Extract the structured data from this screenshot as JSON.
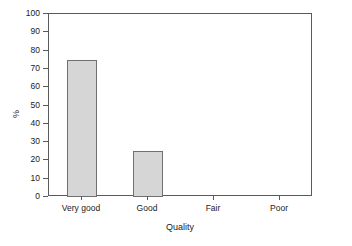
{
  "chart_data": {
    "type": "bar",
    "title": "",
    "subtitle": "",
    "categories": [
      "Very good",
      "Good",
      "Fair",
      "Poor"
    ],
    "values": [
      75,
      25,
      0,
      0
    ],
    "xlabel": "Quality",
    "ylabel": "%",
    "ylim": [
      0,
      100
    ],
    "ytick_labels": [
      "100",
      "90",
      "80",
      "70",
      "60",
      "50",
      "40",
      "30",
      "20",
      "10",
      "0"
    ],
    "ytick_values": [
      100,
      90,
      80,
      70,
      60,
      50,
      40,
      30,
      20,
      10,
      0
    ],
    "grid": false,
    "legend": false,
    "legend_position": "none",
    "annotations": [],
    "colors": {
      "bar_fill": "#d6d6d6",
      "bar_border": "#707070",
      "axis": "#5a5a5a",
      "text": "#1a1a1a",
      "background": "#ffffff"
    }
  }
}
